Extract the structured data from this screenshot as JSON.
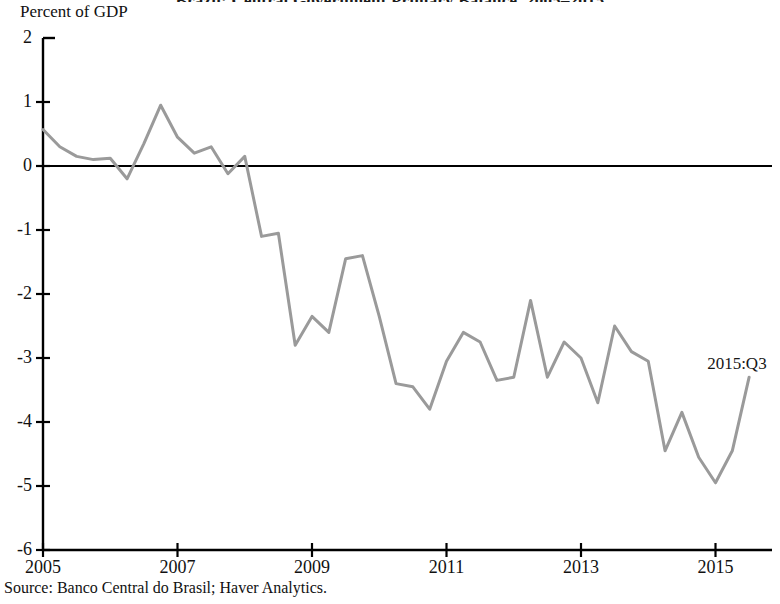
{
  "chart_data": {
    "type": "line",
    "title": "Brazil: Central Government Primary Balance, 2005–2015",
    "title_clipped": true,
    "ylabel": "Percent of GDP",
    "xlabel": "",
    "source": "Source: Banco Central do Brasil; Haver Analytics.",
    "annotations": [
      {
        "text": "2015:Q3",
        "x": "2015Q3",
        "y": -3.3
      }
    ],
    "ylim": [
      -6,
      2
    ],
    "yticks": [
      2,
      1,
      0,
      -1,
      -2,
      -3,
      -4,
      -5,
      -6
    ],
    "ytick_labels": [
      "2",
      "1",
      "0",
      "-1",
      "-2",
      "-3",
      "-4",
      "-5",
      "-6"
    ],
    "xlim": [
      "2005Q1",
      "2015Q4"
    ],
    "xticks": [
      "2005Q1",
      "2007Q1",
      "2009Q1",
      "2011Q1",
      "2013Q1",
      "2015Q1"
    ],
    "xtick_labels": [
      "2005",
      "2007",
      "2009",
      "2011",
      "2013",
      "2015"
    ],
    "grid": false,
    "legend": false,
    "zero_line": true,
    "line_color": "#9a9a9a",
    "axis_color": "#000000",
    "series": [
      {
        "name": "Central Government Primary Balance",
        "color": "#9a9a9a",
        "x": [
          "2005Q1",
          "2005Q2",
          "2005Q3",
          "2005Q4",
          "2006Q1",
          "2006Q2",
          "2006Q3",
          "2006Q4",
          "2007Q1",
          "2007Q2",
          "2007Q3",
          "2007Q4",
          "2008Q1",
          "2008Q2",
          "2008Q3",
          "2008Q4",
          "2009Q1",
          "2009Q2",
          "2009Q3",
          "2009Q4",
          "2010Q1",
          "2010Q2",
          "2010Q3",
          "2010Q4",
          "2011Q1",
          "2011Q2",
          "2011Q3",
          "2011Q4",
          "2012Q1",
          "2012Q2",
          "2012Q3",
          "2012Q4",
          "2013Q1",
          "2013Q2",
          "2013Q3",
          "2013Q4",
          "2014Q1",
          "2014Q2",
          "2014Q3",
          "2014Q4",
          "2015Q1",
          "2015Q2",
          "2015Q3"
        ],
        "values": [
          0.57,
          0.3,
          0.15,
          0.1,
          0.12,
          -0.2,
          0.35,
          0.95,
          0.45,
          0.2,
          0.3,
          -0.12,
          0.15,
          -1.1,
          -1.05,
          -2.8,
          -2.35,
          -2.6,
          -1.45,
          -1.4,
          -2.35,
          -3.4,
          -3.45,
          -3.8,
          -3.05,
          -2.6,
          -2.75,
          -3.35,
          -3.3,
          -2.1,
          -3.3,
          -2.75,
          -3.0,
          -3.7,
          -2.5,
          -2.9,
          -3.05,
          -4.45,
          -3.85,
          -4.55,
          -4.95,
          -4.45,
          -3.3
        ]
      }
    ]
  }
}
